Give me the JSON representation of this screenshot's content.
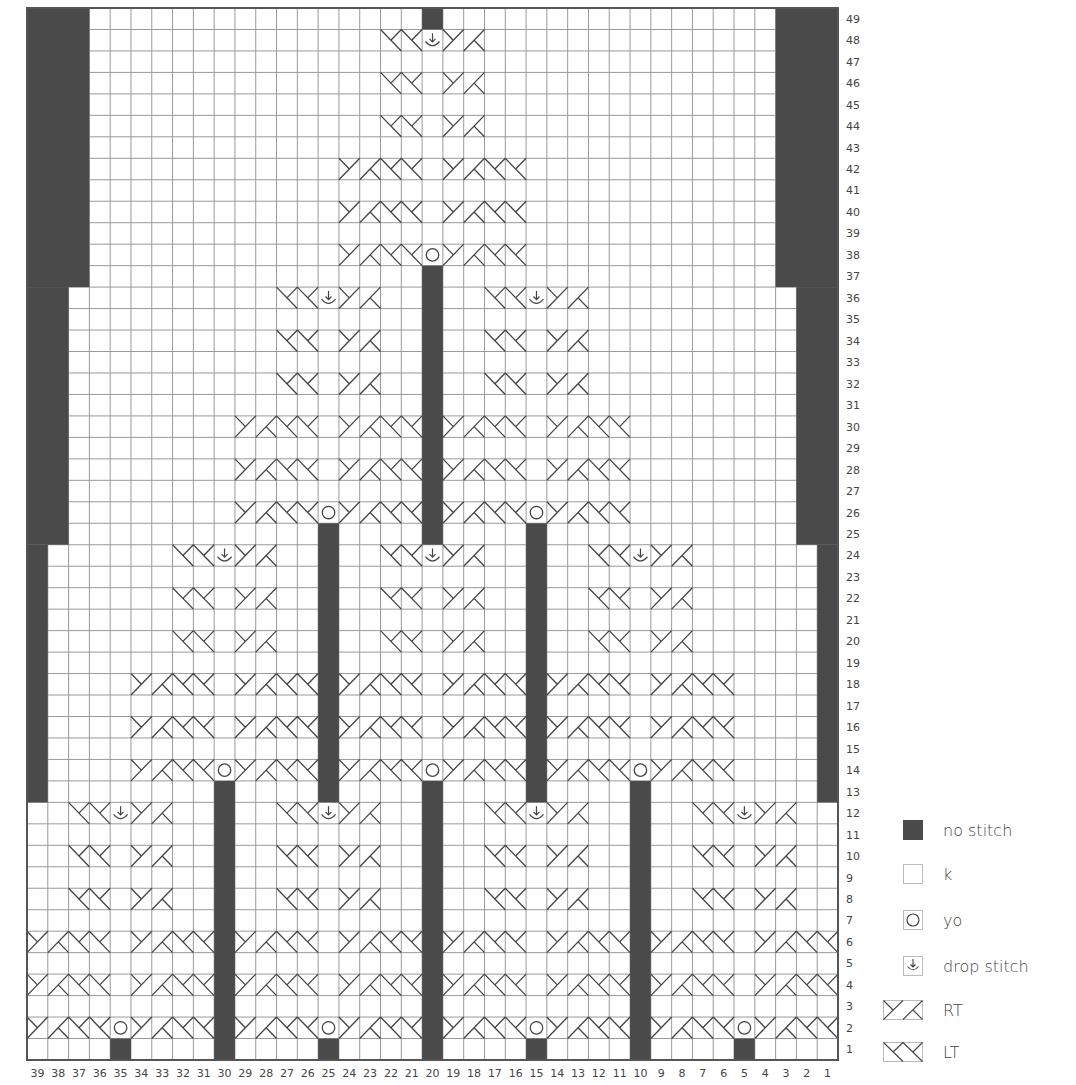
{
  "chart": {
    "title": "",
    "columns": 39,
    "rows": 49,
    "column_labels_order": "right-to-left",
    "row_labels_side": "right",
    "colors": {
      "grid_line": "#9a9a9a",
      "no_stitch": "#4a4a4a",
      "background": "#ffffff",
      "border": "#555555",
      "label_text": "#444444",
      "symbol_line": "#444444"
    },
    "no_stitch_regions": [
      {
        "cols": [
          37,
          39
        ],
        "rows": [
          37,
          49
        ]
      },
      {
        "cols": [
          1,
          3
        ],
        "rows": [
          37,
          49
        ]
      },
      {
        "cols": [
          38,
          39
        ],
        "rows": [
          25,
          36
        ]
      },
      {
        "cols": [
          1,
          2
        ],
        "rows": [
          25,
          36
        ]
      },
      {
        "cols": [
          39,
          39
        ],
        "rows": [
          13,
          24
        ]
      },
      {
        "cols": [
          1,
          1
        ],
        "rows": [
          13,
          24
        ]
      },
      {
        "cols": [
          20,
          20
        ],
        "rows": [
          49,
          49
        ]
      },
      {
        "cols": [
          20,
          20
        ],
        "rows": [
          25,
          37
        ]
      },
      {
        "cols": [
          25,
          25
        ],
        "rows": [
          13,
          25
        ]
      },
      {
        "cols": [
          15,
          15
        ],
        "rows": [
          13,
          25
        ]
      },
      {
        "cols": [
          30,
          30
        ],
        "rows": [
          1,
          13
        ]
      },
      {
        "cols": [
          20,
          20
        ],
        "rows": [
          1,
          13
        ]
      },
      {
        "cols": [
          10,
          10
        ],
        "rows": [
          1,
          13
        ]
      },
      {
        "cols": [
          35,
          35
        ],
        "rows": [
          1,
          1
        ]
      },
      {
        "cols": [
          25,
          25
        ],
        "rows": [
          1,
          1
        ]
      },
      {
        "cols": [
          15,
          15
        ],
        "rows": [
          1,
          1
        ]
      },
      {
        "cols": [
          5,
          5
        ],
        "rows": [
          1,
          1
        ]
      }
    ],
    "yo": [
      {
        "col": 35,
        "row": 2
      },
      {
        "col": 25,
        "row": 2
      },
      {
        "col": 15,
        "row": 2
      },
      {
        "col": 5,
        "row": 2
      },
      {
        "col": 30,
        "row": 14
      },
      {
        "col": 20,
        "row": 14
      },
      {
        "col": 10,
        "row": 14
      },
      {
        "col": 25,
        "row": 26
      },
      {
        "col": 15,
        "row": 26
      },
      {
        "col": 20,
        "row": 38
      }
    ],
    "drop_stitch": [
      {
        "col": 35,
        "row": 12
      },
      {
        "col": 25,
        "row": 12
      },
      {
        "col": 15,
        "row": 12
      },
      {
        "col": 5,
        "row": 12
      },
      {
        "col": 30,
        "row": 24
      },
      {
        "col": 20,
        "row": 24
      },
      {
        "col": 10,
        "row": 24
      },
      {
        "col": 25,
        "row": 36
      },
      {
        "col": 15,
        "row": 36
      },
      {
        "col": 20,
        "row": 48
      }
    ],
    "motifs": [
      {
        "center": 35,
        "rows": [
          2,
          12
        ],
        "wide_rows": [
          2,
          6
        ]
      },
      {
        "center": 25,
        "rows": [
          2,
          12
        ],
        "wide_rows": [
          2,
          6
        ]
      },
      {
        "center": 15,
        "rows": [
          2,
          12
        ],
        "wide_rows": [
          2,
          6
        ]
      },
      {
        "center": 5,
        "rows": [
          2,
          12
        ],
        "wide_rows": [
          2,
          6
        ]
      },
      {
        "center": 30,
        "rows": [
          14,
          24
        ],
        "wide_rows": [
          14,
          18
        ]
      },
      {
        "center": 20,
        "rows": [
          14,
          24
        ],
        "wide_rows": [
          14,
          18
        ]
      },
      {
        "center": 10,
        "rows": [
          14,
          24
        ],
        "wide_rows": [
          14,
          18
        ]
      },
      {
        "center": 25,
        "rows": [
          26,
          36
        ],
        "wide_rows": [
          26,
          30
        ]
      },
      {
        "center": 15,
        "rows": [
          26,
          36
        ],
        "wide_rows": [
          26,
          30
        ]
      },
      {
        "center": 20,
        "rows": [
          38,
          48
        ],
        "wide_rows": [
          38,
          42
        ]
      }
    ]
  },
  "row_numbers": [
    1,
    2,
    3,
    4,
    5,
    6,
    7,
    8,
    9,
    10,
    11,
    12,
    13,
    14,
    15,
    16,
    17,
    18,
    19,
    20,
    21,
    22,
    23,
    24,
    25,
    26,
    27,
    28,
    29,
    30,
    31,
    32,
    33,
    34,
    35,
    36,
    37,
    38,
    39,
    40,
    41,
    42,
    43,
    44,
    45,
    46,
    47,
    48,
    49
  ],
  "column_numbers": [
    39,
    38,
    37,
    36,
    35,
    34,
    33,
    32,
    31,
    30,
    29,
    28,
    27,
    26,
    25,
    24,
    23,
    22,
    21,
    20,
    19,
    18,
    17,
    16,
    15,
    14,
    13,
    12,
    11,
    10,
    9,
    8,
    7,
    6,
    5,
    4,
    3,
    2,
    1
  ],
  "legend": {
    "items": [
      {
        "symbol": "no-stitch",
        "label": "no stitch"
      },
      {
        "symbol": "knit",
        "label": "k"
      },
      {
        "symbol": "yarn-over",
        "label": "yo"
      },
      {
        "symbol": "drop-stitch",
        "label": "drop stitch"
      },
      {
        "symbol": "right-twist",
        "label": "RT"
      },
      {
        "symbol": "left-twist",
        "label": "LT"
      }
    ]
  }
}
